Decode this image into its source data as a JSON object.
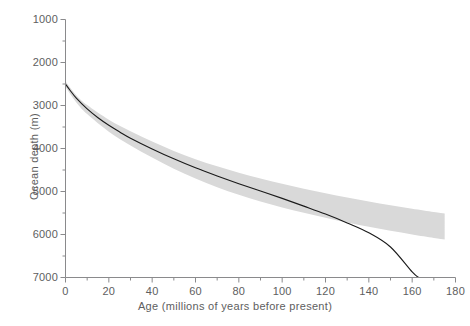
{
  "figure": {
    "background_color": "#ffffff",
    "axis_color": "#8a8a8c",
    "text_color": "#5e5e60",
    "curve_color": "#1a1a1a",
    "band_color": "#d9d9d9"
  },
  "axes": {
    "x_title": "Age (millions of years before present)",
    "y_title": "Ocean depth (m)"
  },
  "chart_data": {
    "type": "line",
    "title": "",
    "subtitle": "",
    "xlabel": "Age (millions of years before present)",
    "ylabel": "Ocean depth (m)",
    "xlim": [
      0,
      180
    ],
    "ylim": [
      7000,
      1000
    ],
    "y_inverted": true,
    "grid": false,
    "legend": null,
    "legend_position": "none",
    "x_ticks": [
      0,
      20,
      40,
      60,
      80,
      100,
      120,
      140,
      160,
      180
    ],
    "x_tick_labels": [
      "0",
      "20",
      "40",
      "60",
      "80",
      "100",
      "120",
      "140",
      "160",
      "180"
    ],
    "x_minor_ticks": [
      10,
      30,
      50,
      70,
      90,
      110,
      130,
      150,
      170
    ],
    "y_ticks": [
      1000,
      2000,
      3000,
      4000,
      5000,
      6000,
      7000
    ],
    "y_tick_labels": [
      "1000",
      "2000",
      "3000",
      "4000",
      "5000",
      "6000",
      "7000"
    ],
    "y_minor_ticks": [
      1500,
      2500,
      3500,
      4500,
      5500,
      6500
    ],
    "series": [
      {
        "name": "Theoretical subsidence curve",
        "type": "line",
        "color": "#1a1a1a",
        "x": [
          0,
          2,
          5,
          10,
          15,
          20,
          25,
          30,
          40,
          50,
          60,
          70,
          80,
          90,
          100,
          110,
          120,
          130,
          140,
          150,
          160,
          163
        ],
        "y": [
          2500,
          2640,
          2830,
          3080,
          3285,
          3460,
          3615,
          3760,
          4010,
          4240,
          4450,
          4640,
          4820,
          4990,
          5160,
          5340,
          5525,
          5730,
          5960,
          6290,
          6870,
          7000
        ]
      },
      {
        "name": "Observed depth envelope (shaded band)",
        "type": "band",
        "color": "#d9d9d9",
        "x": [
          0,
          5,
          10,
          20,
          30,
          40,
          50,
          60,
          70,
          80,
          90,
          100,
          110,
          120,
          130,
          140,
          150,
          160,
          170,
          175
        ],
        "y_upper": [
          2440,
          2760,
          2990,
          3330,
          3600,
          3840,
          4060,
          4250,
          4415,
          4565,
          4700,
          4820,
          4935,
          5040,
          5140,
          5230,
          5320,
          5400,
          5475,
          5510
        ],
        "y_lower": [
          2570,
          2930,
          3200,
          3610,
          3930,
          4210,
          4470,
          4700,
          4900,
          5075,
          5230,
          5370,
          5495,
          5610,
          5720,
          5820,
          5915,
          6000,
          6080,
          6115
        ]
      }
    ],
    "annotations": []
  }
}
